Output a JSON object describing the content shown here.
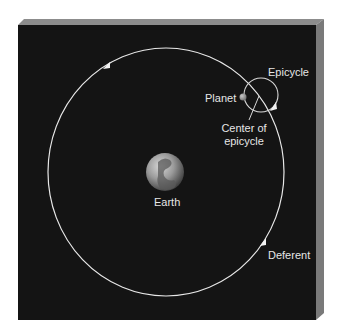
{
  "diagram": {
    "colors": {
      "background_panel": "#141414",
      "bevel_top": "#8c8c8c",
      "bevel_side": "#7a7a7a",
      "orbit_line": "#e8e8e8",
      "label_text": "#e6e6e6",
      "planet": "#9a9a9a"
    },
    "labels": {
      "epicycle": "Epicycle",
      "planet": "Planet",
      "center_line1": "Center of",
      "center_line2": "epicycle",
      "earth": "Earth",
      "deferent": "Deferent"
    },
    "elements": {
      "deferent": {
        "cx": 166,
        "cy": 172,
        "rx": 118,
        "ry": 124,
        "direction": "counterclockwise"
      },
      "epicycle": {
        "cx": 261,
        "cy": 95,
        "r": 17
      },
      "planet": {
        "cx": 243,
        "cy": 97,
        "r": 3.5
      },
      "earth": {
        "cx": 165,
        "cy": 172,
        "r": 19
      }
    }
  }
}
